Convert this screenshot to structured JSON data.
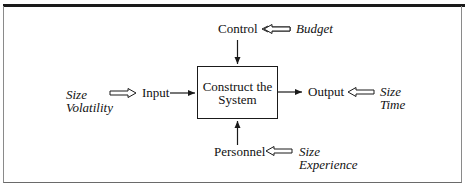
{
  "diagram": {
    "process": {
      "line1": "Construct the",
      "line2": "System"
    },
    "control": {
      "label": "Control",
      "influences": [
        "Budget"
      ]
    },
    "input": {
      "label": "Input",
      "influences": [
        "Size",
        "Volatility"
      ]
    },
    "output": {
      "label": "Output",
      "influences": [
        "Size",
        "Time"
      ]
    },
    "personnel": {
      "label": "Personnel",
      "influences": [
        "Size",
        "Experience"
      ]
    }
  },
  "colors": {
    "line": "#1a1a1a",
    "frame": "#8a8a8a",
    "background": "#ffffff"
  }
}
